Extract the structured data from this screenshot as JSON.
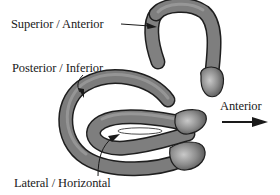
{
  "diagram": {
    "labels": {
      "superior": "Superior / Anterior",
      "posterior": "Posterior / Inferior",
      "lateral": "Lateral / Horizontal",
      "direction": "Anterior"
    },
    "direction_arrow": {
      "label": "Anterior",
      "orientation": "right"
    },
    "colors": {
      "canal_fill": "#7a7a7a",
      "canal_highlight": "#b8b8b8",
      "canal_outline": "#1e1e1e",
      "text": "#1a1a1a",
      "background": "#ffffff"
    }
  }
}
